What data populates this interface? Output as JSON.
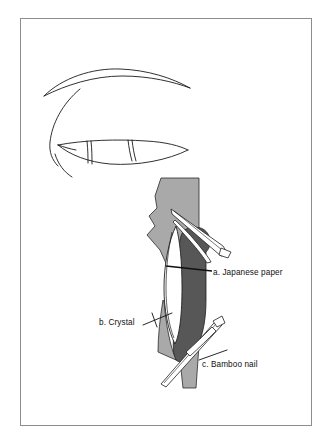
{
  "figure": {
    "kind": "technical-line-illustration",
    "caption_labels": [
      {
        "key": "a",
        "text": "a. Japanese paper"
      },
      {
        "key": "b",
        "text": "b. Crystal"
      },
      {
        "key": "c",
        "text": "c. Bamboo nail"
      }
    ],
    "panels": [
      {
        "id": "upper",
        "name": "outline-eye-shape",
        "description": "Open line drawing of a curved leaf/eye shaped outline with a long arched stroke above and a narrow lens shape below crossed by two short segments"
      },
      {
        "id": "lower",
        "name": "cross-section-assembly",
        "description": "Shaded cross section showing a light grey vertical band, a dark grey mass, a white lens shaped crystal and two tapered bamboo nails piercing the assembly"
      }
    ]
  },
  "colors": {
    "background": "#ffffff",
    "frame_border": "#8d8d8d",
    "ink": "#1a1a1a",
    "light_grey": "#a9a9a9",
    "mid_grey": "#8f8f8f",
    "dark_grey": "#575757",
    "white_fill": "#ffffff",
    "label_text": "#101010"
  }
}
